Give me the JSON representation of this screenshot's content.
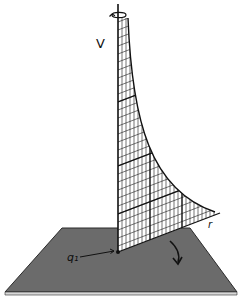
{
  "figure": {
    "labels": {
      "vertical_axis": "V",
      "radial_axis": "r",
      "charge": "q₁"
    },
    "icons": {
      "rotation_arrow": "rotation-arrow-icon",
      "sweep_arrow": "curved-arrow-icon"
    },
    "colors": {
      "plane": "#6b6b6b",
      "plane_edge": "#2b2b2b",
      "grid_fill": "#ffffff",
      "lines": "#111111",
      "background": "#ffffff"
    }
  }
}
